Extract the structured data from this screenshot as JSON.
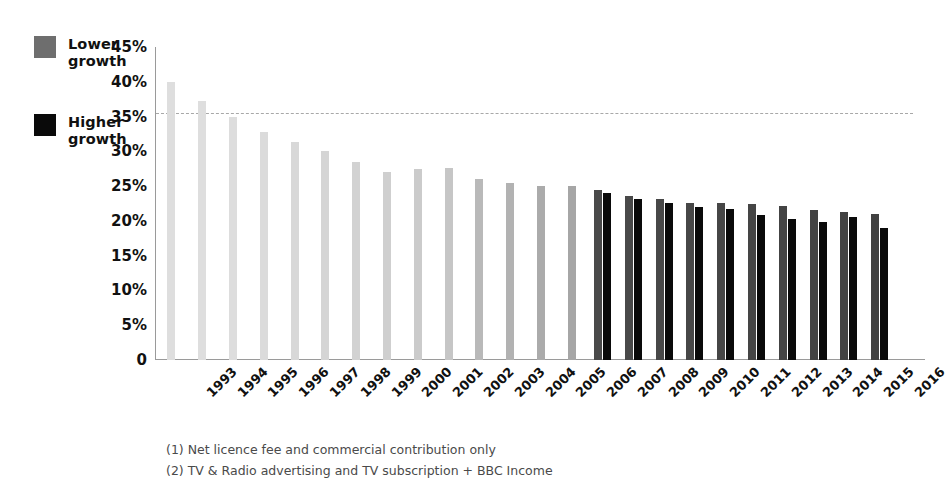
{
  "legend": {
    "items": [
      {
        "label": "Lower\ngrowth",
        "color": "#6e6e6e",
        "name": "lower-growth"
      },
      {
        "label": "Higher\ngrowth",
        "color": "#0a0a0a",
        "name": "higher-growth"
      }
    ]
  },
  "footnotes": [
    "(1) Net licence fee and commercial contribution only",
    "(2) TV & Radio advertising and TV subscription + BBC Income"
  ],
  "chart_data": {
    "type": "bar",
    "title": "",
    "xlabel": "",
    "ylabel": "",
    "ylim": [
      0,
      45
    ],
    "ytick_values": [
      0,
      5,
      10,
      15,
      20,
      25,
      30,
      35,
      40,
      45
    ],
    "ytick_labels": [
      "0",
      "5%",
      "10%",
      "15%",
      "20%",
      "25%",
      "30%",
      "35%",
      "40%",
      "45%"
    ],
    "grid": false,
    "legend_position": "top-left",
    "reference_line": {
      "value": 35.5,
      "style": "dashed",
      "color": "#a8a8a8"
    },
    "categories": [
      "1993",
      "1994",
      "1995",
      "1996",
      "1997",
      "1998",
      "1999",
      "2000",
      "2001",
      "2002",
      "2003",
      "2004",
      "2005",
      "2006",
      "2007",
      "2008",
      "2009",
      "2010",
      "2011",
      "2012",
      "2013",
      "2014",
      "2015",
      "2016"
    ],
    "series": [
      {
        "name": "Lower growth",
        "values": [
          40.0,
          37.2,
          35.0,
          32.8,
          31.4,
          30.1,
          28.5,
          27.0,
          27.5,
          27.6,
          26.0,
          25.5,
          25.0,
          25.0,
          24.5,
          23.6,
          23.1,
          22.6,
          22.6,
          22.5,
          22.2,
          21.6,
          21.3,
          21.0
        ],
        "colors": [
          "#dedede",
          "#dedede",
          "#dddddd",
          "#dbdbdb",
          "#d8d8d8",
          "#d5d5d5",
          "#d2d2d2",
          "#cfcfcf",
          "#cbcbcb",
          "#c6c6c6",
          "#b9b9b9",
          "#b2b2b2",
          "#ababab",
          "#a6a6a6",
          "#4a4a4a",
          "#494949",
          "#484848",
          "#474747",
          "#464646",
          "#454545",
          "#444444",
          "#434343",
          "#424242",
          "#414141"
        ]
      },
      {
        "name": "Higher growth",
        "values": [
          null,
          null,
          null,
          null,
          null,
          null,
          null,
          null,
          null,
          null,
          null,
          null,
          null,
          null,
          24.0,
          23.1,
          22.6,
          22.0,
          21.7,
          20.9,
          20.3,
          19.8,
          20.5,
          19.0
        ],
        "colors": [
          "#0a0a0a"
        ]
      }
    ]
  }
}
